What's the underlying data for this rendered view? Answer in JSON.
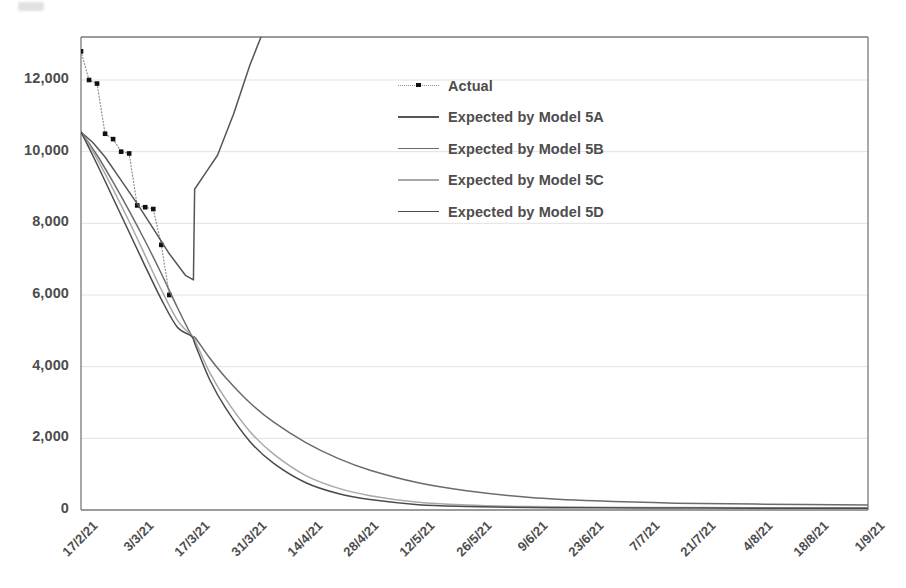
{
  "chart_data": {
    "type": "line",
    "title": "",
    "xlabel": "",
    "ylabel": "",
    "ylim": [
      0,
      13200
    ],
    "yticks": [
      0,
      2000,
      4000,
      6000,
      8000,
      10000,
      12000
    ],
    "ytick_labels": [
      "0",
      "2,000",
      "4,000",
      "6,000",
      "8,000",
      "10,000",
      "12,000"
    ],
    "grid": "horizontal",
    "legend_position": "upper-center",
    "x_start_date": "17/2/21",
    "x_end_date": "1/9/21",
    "x_total_days": 196,
    "xtick_labels": [
      "17/2/21",
      "3/3/21",
      "17/3/21",
      "31/3/21",
      "14/4/21",
      "28/4/21",
      "12/5/21",
      "26/5/21",
      "9/6/21",
      "23/6/21",
      "7/7/21",
      "21/7/21",
      "4/8/21",
      "18/8/21",
      "1/9/21"
    ],
    "xtick_days": [
      0,
      14,
      28,
      42,
      56,
      70,
      84,
      98,
      112,
      126,
      140,
      154,
      168,
      182,
      196
    ],
    "series": [
      {
        "name": "Actual",
        "style": "dotted-markers",
        "color": "#8d8d8d",
        "marker_color": "#111111",
        "x_days": [
          0,
          2,
          4,
          6,
          8,
          10,
          12,
          14,
          16,
          18,
          20,
          22
        ],
        "values": [
          12800,
          12000,
          11900,
          10500,
          10350,
          10000,
          9950,
          8500,
          8450,
          8400,
          7400,
          6000
        ]
      },
      {
        "name": "Expected by Model 5A",
        "style": "solid",
        "color": "#555555",
        "x_days": [
          0,
          3,
          6,
          10,
          14,
          18,
          22,
          26,
          28,
          28.3,
          31,
          34,
          38,
          42,
          45
        ],
        "values": [
          10550,
          10250,
          9850,
          9200,
          8550,
          7850,
          7150,
          6550,
          6420,
          8950,
          9400,
          9900,
          11050,
          12400,
          13250
        ]
      },
      {
        "name": "Expected by Model 5B",
        "style": "solid",
        "color": "#6b6b6b",
        "x_days": [
          0,
          4,
          8,
          12,
          16,
          20,
          24,
          27.5,
          28.5,
          32,
          36,
          42,
          48,
          56,
          64,
          72,
          84,
          96,
          112,
          128,
          148,
          168,
          196
        ],
        "values": [
          10550,
          9900,
          9150,
          8350,
          7500,
          6600,
          5650,
          4880,
          4800,
          4250,
          3700,
          3000,
          2450,
          1880,
          1440,
          1110,
          760,
          540,
          350,
          255,
          190,
          165,
          140
        ]
      },
      {
        "name": "Expected by Model 5C",
        "style": "solid",
        "color": "#a8a8a8",
        "x_days": [
          0,
          4,
          8,
          12,
          16,
          20,
          24,
          27.5,
          28.5,
          32,
          36,
          42,
          48,
          56,
          64,
          72,
          84,
          96,
          112,
          128,
          148,
          168,
          196
        ],
        "values": [
          10550,
          9800,
          8950,
          8050,
          7100,
          6150,
          5300,
          4870,
          4700,
          3850,
          3100,
          2200,
          1560,
          960,
          610,
          400,
          215,
          140,
          95,
          80,
          70,
          65,
          60
        ]
      },
      {
        "name": "Expected by Model 5D",
        "style": "solid",
        "color": "#4a4a4a",
        "x_days": [
          0,
          4,
          8,
          12,
          16,
          20,
          24,
          27.5,
          28.5,
          32,
          36,
          42,
          48,
          56,
          64,
          72,
          84,
          96,
          112,
          128,
          148,
          168,
          196
        ],
        "values": [
          10550,
          9650,
          8700,
          7750,
          6800,
          5880,
          5100,
          4850,
          4600,
          3650,
          2850,
          1920,
          1300,
          760,
          460,
          290,
          150,
          100,
          70,
          60,
          55,
          52,
          50
        ]
      }
    ]
  },
  "legend": {
    "items": [
      {
        "label": "Actual",
        "style": "dotted-markers",
        "color": "#8d8d8d"
      },
      {
        "label": "Expected by Model 5A",
        "style": "solid",
        "color": "#555555"
      },
      {
        "label": "Expected by Model 5B",
        "style": "solid",
        "color": "#6b6b6b"
      },
      {
        "label": "Expected by Model 5C",
        "style": "solid",
        "color": "#a8a8a8"
      },
      {
        "label": "Expected by Model 5D",
        "style": "solid",
        "color": "#4a4a4a"
      }
    ]
  },
  "axes": {
    "frame_color": "#7a7a7a",
    "grid_color": "#e2e2e2",
    "tick_text_color": "#4d4d4d"
  }
}
